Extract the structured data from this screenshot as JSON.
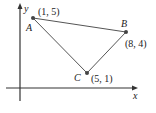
{
  "diagram": {
    "type": "coordinate-plane-triangle",
    "axes": {
      "x_label": "x",
      "y_label": "y"
    },
    "points": [
      {
        "name": "A",
        "coord_label": "(1, 5)",
        "x": 1,
        "y": 5
      },
      {
        "name": "B",
        "coord_label": "(8, 4)",
        "x": 8,
        "y": 4
      },
      {
        "name": "C",
        "coord_label": "(5, 1)",
        "x": 5,
        "y": 1
      }
    ],
    "segments": [
      "AB",
      "BC",
      "CA"
    ],
    "colors": {
      "line": "#555555",
      "point": "#444444",
      "axis": "#333333"
    }
  }
}
